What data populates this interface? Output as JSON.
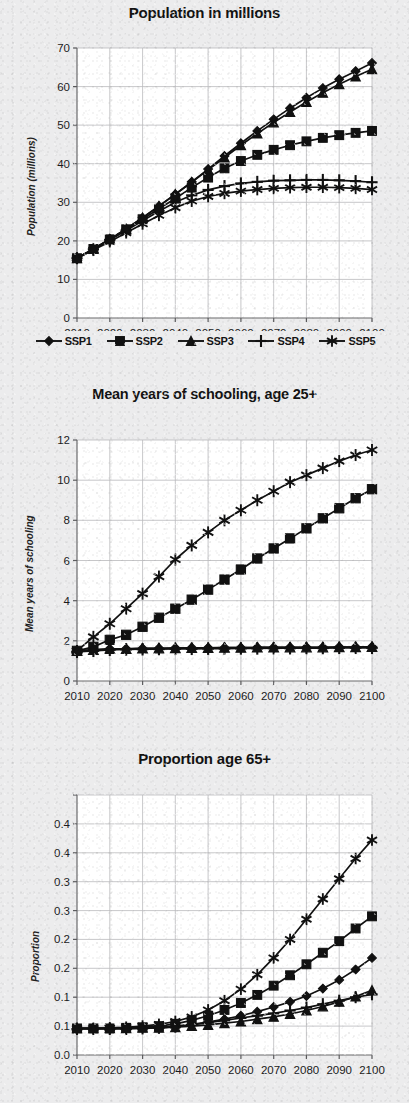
{
  "figure": {
    "series_names": [
      "SSP1",
      "SSP2",
      "SSP3",
      "SSP4",
      "SSP5"
    ],
    "markers": [
      "diamond-marker",
      "square-marker",
      "triangle-marker",
      "plus-marker",
      "asterisk-marker"
    ],
    "line_color": "#111111",
    "grid_color": "#b9b9bb",
    "background_color": "#ececed",
    "plot_background_color": "#ffffff"
  },
  "legend": {
    "items": [
      {
        "label": "SSP1",
        "marker": "diamond-marker"
      },
      {
        "label": "SSP2",
        "marker": "square-marker"
      },
      {
        "label": "SSP3",
        "marker": "triangle-marker"
      },
      {
        "label": "SSP4",
        "marker": "plus-marker"
      },
      {
        "label": "SSP5",
        "marker": "asterisk-marker"
      }
    ]
  },
  "chart_data": [
    {
      "type": "line",
      "title": "Population in millions",
      "xlabel": "",
      "ylabel": "Population (millions)",
      "x": [
        2010,
        2015,
        2020,
        2025,
        2030,
        2035,
        2040,
        2045,
        2050,
        2055,
        2060,
        2065,
        2070,
        2075,
        2080,
        2085,
        2090,
        2095,
        2100
      ],
      "xlim": [
        2010,
        2100
      ],
      "ylim": [
        0,
        70
      ],
      "xticks": [
        2010,
        2020,
        2030,
        2040,
        2050,
        2060,
        2070,
        2080,
        2090,
        2100
      ],
      "xticklabels": [
        "2010",
        "2020",
        "2030",
        "2040",
        "2050",
        "2060",
        "2070",
        "2080",
        "2090",
        "2100"
      ],
      "yticks": [
        0,
        10,
        20,
        30,
        40,
        50,
        60,
        70
      ],
      "yticklabels": [
        "0",
        "10",
        "20",
        "30",
        "40",
        "50",
        "60",
        "70"
      ],
      "grid": true,
      "legend_position": "bottom",
      "series": [
        {
          "name": "SSP1",
          "marker": "diamond-marker",
          "values": [
            15.5,
            17.9,
            20.4,
            23.1,
            26.0,
            29.0,
            32.1,
            35.3,
            38.6,
            42.0,
            45.3,
            48.5,
            51.5,
            54.4,
            57.1,
            59.6,
            61.9,
            64.0,
            66.1
          ]
        },
        {
          "name": "SSP2",
          "marker": "square-marker",
          "values": [
            15.5,
            17.9,
            20.4,
            23.0,
            25.6,
            28.3,
            31.0,
            33.8,
            36.4,
            38.8,
            40.7,
            42.3,
            43.6,
            44.8,
            45.8,
            46.7,
            47.4,
            48.0,
            48.5
          ]
        },
        {
          "name": "SSP3",
          "marker": "triangle-marker",
          "values": [
            15.5,
            17.9,
            20.4,
            23.1,
            26.0,
            29.0,
            32.1,
            35.2,
            38.4,
            41.6,
            44.8,
            47.8,
            50.7,
            53.4,
            56.0,
            58.4,
            60.6,
            62.6,
            64.5
          ]
        },
        {
          "name": "SSP4",
          "marker": "plus-marker",
          "values": [
            15.5,
            17.8,
            20.2,
            22.7,
            25.2,
            27.7,
            30.0,
            31.8,
            33.2,
            34.2,
            34.9,
            35.3,
            35.6,
            35.7,
            35.8,
            35.8,
            35.7,
            35.5,
            35.2
          ]
        },
        {
          "name": "SSP5",
          "marker": "asterisk-marker",
          "values": [
            15.5,
            17.6,
            19.8,
            22.1,
            24.4,
            26.6,
            28.6,
            30.3,
            31.5,
            32.3,
            32.9,
            33.3,
            33.6,
            33.8,
            33.9,
            33.9,
            33.8,
            33.6,
            33.3
          ]
        }
      ]
    },
    {
      "type": "line",
      "title": "Mean years of schooling, age 25+",
      "xlabel": "",
      "ylabel": "Mean years of schooling",
      "x": [
        2010,
        2015,
        2020,
        2025,
        2030,
        2035,
        2040,
        2045,
        2050,
        2055,
        2060,
        2065,
        2070,
        2075,
        2080,
        2085,
        2090,
        2095,
        2100
      ],
      "xlim": [
        2010,
        2100
      ],
      "ylim": [
        0,
        12
      ],
      "xticks": [
        2010,
        2020,
        2030,
        2040,
        2050,
        2060,
        2070,
        2080,
        2090,
        2100
      ],
      "xticklabels": [
        "2010",
        "2020",
        "2030",
        "2040",
        "2050",
        "2060",
        "2070",
        "2080",
        "2090",
        "2100"
      ],
      "yticks": [
        0,
        2,
        4,
        6,
        8,
        10,
        12
      ],
      "yticklabels": [
        "0",
        "2",
        "4",
        "6",
        "8",
        "10",
        "12"
      ],
      "grid": true,
      "legend_position": "none",
      "series": [
        {
          "name": "SSP1",
          "marker": "diamond-marker",
          "values": [
            1.5,
            1.55,
            1.6,
            1.6,
            1.62,
            1.63,
            1.64,
            1.65,
            1.65,
            1.66,
            1.66,
            1.67,
            1.67,
            1.68,
            1.68,
            1.68,
            1.69,
            1.69,
            1.7
          ]
        },
        {
          "name": "SSP2",
          "marker": "square-marker",
          "values": [
            1.5,
            1.7,
            2.05,
            2.3,
            2.7,
            3.15,
            3.6,
            4.05,
            4.55,
            5.05,
            5.55,
            6.1,
            6.6,
            7.1,
            7.6,
            8.1,
            8.6,
            9.1,
            9.55
          ]
        },
        {
          "name": "SSP3",
          "marker": "triangle-marker",
          "values": [
            1.5,
            1.55,
            1.6,
            1.6,
            1.62,
            1.63,
            1.64,
            1.65,
            1.65,
            1.66,
            1.66,
            1.67,
            1.67,
            1.68,
            1.68,
            1.68,
            1.69,
            1.69,
            1.7
          ]
        },
        {
          "name": "SSP4",
          "marker": "plus-marker",
          "values": [
            1.45,
            1.5,
            1.55,
            1.57,
            1.58,
            1.59,
            1.6,
            1.6,
            1.61,
            1.61,
            1.62,
            1.62,
            1.63,
            1.63,
            1.64,
            1.64,
            1.65,
            1.65,
            1.65
          ]
        },
        {
          "name": "SSP5",
          "marker": "asterisk-marker",
          "values": [
            1.5,
            2.2,
            2.85,
            3.6,
            4.35,
            5.2,
            6.05,
            6.75,
            7.4,
            8.0,
            8.5,
            9.0,
            9.45,
            9.9,
            10.25,
            10.6,
            10.95,
            11.25,
            11.5
          ]
        }
      ]
    },
    {
      "type": "line",
      "title": "Proportion age 65+",
      "xlabel": "",
      "ylabel": "Proportion",
      "x": [
        2010,
        2015,
        2020,
        2025,
        2030,
        2035,
        2040,
        2045,
        2050,
        2055,
        2060,
        2065,
        2070,
        2075,
        2080,
        2085,
        2090,
        2095,
        2100
      ],
      "xlim": [
        2010,
        2100
      ],
      "ylim": [
        0.0,
        0.45
      ],
      "xticks": [
        2010,
        2020,
        2030,
        2040,
        2050,
        2060,
        2070,
        2080,
        2090,
        2100
      ],
      "xticklabels": [
        "2010",
        "2020",
        "2030",
        "2040",
        "2050",
        "2060",
        "2070",
        "2080",
        "2090",
        "2100"
      ],
      "yticks": [
        0.0,
        0.05,
        0.1,
        0.15,
        0.2,
        0.25,
        0.3,
        0.35,
        0.4,
        0.45
      ],
      "yticklabels": [
        "0.0",
        "0.1",
        "0.1",
        "0.2",
        "0.2",
        "0.3",
        "0.3",
        "0.4",
        "0.4"
      ],
      "grid": true,
      "legend_position": "none",
      "series": [
        {
          "name": "SSP1",
          "marker": "diamond-marker",
          "values": [
            0.046,
            0.046,
            0.046,
            0.047,
            0.047,
            0.048,
            0.05,
            0.053,
            0.057,
            0.062,
            0.068,
            0.075,
            0.083,
            0.092,
            0.102,
            0.115,
            0.13,
            0.148,
            0.168
          ]
        },
        {
          "name": "SSP2",
          "marker": "square-marker",
          "values": [
            0.046,
            0.046,
            0.046,
            0.047,
            0.048,
            0.05,
            0.054,
            0.06,
            0.068,
            0.078,
            0.09,
            0.104,
            0.12,
            0.138,
            0.157,
            0.177,
            0.197,
            0.219,
            0.24
          ]
        },
        {
          "name": "SSP3",
          "marker": "triangle-marker",
          "values": [
            0.046,
            0.046,
            0.046,
            0.046,
            0.047,
            0.047,
            0.048,
            0.05,
            0.052,
            0.055,
            0.058,
            0.062,
            0.066,
            0.071,
            0.077,
            0.084,
            0.092,
            0.101,
            0.112
          ]
        },
        {
          "name": "SSP4",
          "marker": "plus-marker",
          "values": [
            0.045,
            0.045,
            0.045,
            0.045,
            0.046,
            0.047,
            0.049,
            0.052,
            0.056,
            0.06,
            0.064,
            0.068,
            0.072,
            0.077,
            0.082,
            0.088,
            0.094,
            0.1,
            0.105
          ]
        },
        {
          "name": "SSP5",
          "marker": "asterisk-marker",
          "values": [
            0.046,
            0.046,
            0.047,
            0.048,
            0.05,
            0.053,
            0.058,
            0.066,
            0.078,
            0.094,
            0.114,
            0.139,
            0.168,
            0.2,
            0.235,
            0.27,
            0.305,
            0.34,
            0.372
          ]
        }
      ]
    }
  ]
}
